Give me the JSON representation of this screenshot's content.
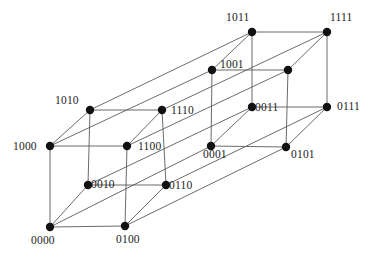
{
  "figure": {
    "name": "tesseract-graph",
    "width": 381,
    "height": 259,
    "background_color": "#ffffff",
    "edge_color": "#5a5a5a",
    "vertex_color": "#111111",
    "label_color": "#232323",
    "vertex_radius": 4.2
  },
  "vertices": [
    {
      "id": "0000",
      "label": "0000",
      "x": 50,
      "y": 227,
      "label_x": 31,
      "label_y": 235,
      "labelled": true
    },
    {
      "id": "1000",
      "label": "1000",
      "x": 50,
      "y": 146,
      "label_x": 13,
      "label_y": 141,
      "labelled": true
    },
    {
      "id": "0100",
      "label": "0100",
      "x": 125,
      "y": 226,
      "label_x": 116,
      "label_y": 234,
      "labelled": true
    },
    {
      "id": "1100",
      "label": "1100",
      "x": 127,
      "y": 146,
      "label_x": 138,
      "label_y": 141,
      "labelled": true
    },
    {
      "id": "0010",
      "label": "0010",
      "x": 88,
      "y": 185,
      "label_x": 91,
      "label_y": 179,
      "labelled": true
    },
    {
      "id": "1010",
      "label": "1010",
      "x": 90,
      "y": 110,
      "label_x": 55,
      "label_y": 95,
      "labelled": true
    },
    {
      "id": "0110",
      "label": "0110",
      "x": 166,
      "y": 185,
      "label_x": 169,
      "label_y": 180,
      "labelled": true
    },
    {
      "id": "1110",
      "label": "1110",
      "x": 162,
      "y": 110,
      "label_x": 171,
      "label_y": 105,
      "labelled": true
    },
    {
      "id": "0001",
      "label": "0001",
      "x": 211,
      "y": 146,
      "label_x": 203,
      "label_y": 149,
      "labelled": true
    },
    {
      "id": "1001",
      "label": "1001",
      "x": 212,
      "y": 70,
      "label_x": 220,
      "label_y": 59,
      "labelled": true
    },
    {
      "id": "0101",
      "label": "0101",
      "x": 286,
      "y": 147,
      "label_x": 291,
      "label_y": 149,
      "labelled": true
    },
    {
      "id": "1101",
      "label": "",
      "x": 288,
      "y": 70,
      "label_x": 296,
      "label_y": 60,
      "labelled": false
    },
    {
      "id": "0011",
      "label": "0011",
      "x": 252,
      "y": 107,
      "label_x": 255,
      "label_y": 102,
      "labelled": true
    },
    {
      "id": "1011",
      "label": "1011",
      "x": 252,
      "y": 32,
      "label_x": 226,
      "label_y": 12,
      "labelled": true
    },
    {
      "id": "0111",
      "label": "0111",
      "x": 327,
      "y": 107,
      "label_x": 337,
      "label_y": 101,
      "labelled": true
    },
    {
      "id": "1111",
      "label": "1111",
      "x": 327,
      "y": 32,
      "label_x": 330,
      "label_y": 12,
      "labelled": true
    }
  ],
  "edges": [
    [
      "0000",
      "1000"
    ],
    [
      "0000",
      "0100"
    ],
    [
      "0000",
      "0010"
    ],
    [
      "0000",
      "0001"
    ],
    [
      "1000",
      "1100"
    ],
    [
      "1000",
      "1010"
    ],
    [
      "1000",
      "1001"
    ],
    [
      "0100",
      "1100"
    ],
    [
      "0100",
      "0110"
    ],
    [
      "0100",
      "0101"
    ],
    [
      "0010",
      "1010"
    ],
    [
      "0010",
      "0110"
    ],
    [
      "0010",
      "0011"
    ],
    [
      "0001",
      "1001"
    ],
    [
      "0001",
      "0101"
    ],
    [
      "0001",
      "0011"
    ],
    [
      "1100",
      "1110"
    ],
    [
      "1100",
      "1101"
    ],
    [
      "1010",
      "1110"
    ],
    [
      "1010",
      "1011"
    ],
    [
      "0110",
      "1110"
    ],
    [
      "0110",
      "0111"
    ],
    [
      "1001",
      "1101"
    ],
    [
      "1001",
      "1011"
    ],
    [
      "0101",
      "1101"
    ],
    [
      "0101",
      "0111"
    ],
    [
      "0011",
      "1011"
    ],
    [
      "0011",
      "0111"
    ],
    [
      "1110",
      "1111"
    ],
    [
      "1101",
      "1111"
    ],
    [
      "1011",
      "1111"
    ],
    [
      "0111",
      "1111"
    ]
  ]
}
